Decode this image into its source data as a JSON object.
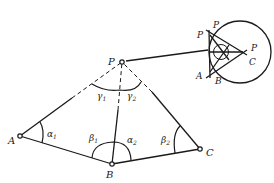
{
  "diagram": {
    "title": "",
    "points": {
      "P": {
        "label": "P",
        "x": 122,
        "y": 62
      },
      "A": {
        "label": "A",
        "x": 20,
        "y": 136
      },
      "B": {
        "label": "B",
        "x": 112,
        "y": 164
      },
      "C": {
        "label": "C",
        "x": 200,
        "y": 149
      }
    },
    "angles": {
      "alpha1": {
        "symbol": "α",
        "sub": "1"
      },
      "alpha2": {
        "symbol": "α",
        "sub": "2"
      },
      "beta1": {
        "symbol": "β",
        "sub": "1"
      },
      "beta2": {
        "symbol": "β",
        "sub": "2"
      },
      "gamma1": {
        "symbol": "γ",
        "sub": "1"
      },
      "gamma2": {
        "symbol": "γ",
        "sub": "2"
      }
    },
    "inset": {
      "labels": {
        "P_top": "P",
        "P_left": "P",
        "P_right": "P",
        "A": "A",
        "B": "B",
        "C": "C"
      }
    },
    "colors": {
      "ink": "#1a1a1a",
      "background": "#ffffff"
    }
  }
}
